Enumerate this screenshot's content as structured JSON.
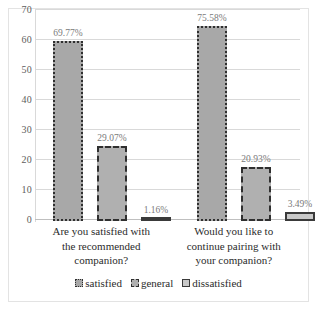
{
  "chart_data": {
    "type": "bar",
    "title": "",
    "subtitle": "",
    "xlabel": "",
    "ylabel": "",
    "ylim": [
      0,
      70
    ],
    "ytick_step": 10,
    "yticks": [
      "70",
      "60",
      "50",
      "40",
      "30",
      "20",
      "10",
      "0"
    ],
    "grid": true,
    "legend_position": "bottom",
    "categories": [
      "Are you satisfied with the recommended companion?",
      "Would you like to continue pairing with your companion?"
    ],
    "category_lines": [
      [
        "Are you satisfied with",
        "the recommended",
        "companion?"
      ],
      [
        "Would you like to",
        "continue pairing with",
        "your companion?"
      ]
    ],
    "series": [
      {
        "name": "satisfied",
        "values": [
          69.77,
          75.58
        ],
        "labels": [
          "69.77%",
          "75.58%"
        ],
        "fill": "#a8a8a8",
        "border": "#2f2f2f",
        "border_style": "dotted"
      },
      {
        "name": "general",
        "values": [
          29.07,
          20.93
        ],
        "labels": [
          "29.07%",
          "20.93%"
        ],
        "fill": "#b0b0b0",
        "border": "#2f2f2f",
        "border_style": "dashed"
      },
      {
        "name": "dissatisfied",
        "values": [
          1.16,
          3.49
        ],
        "labels": [
          "1.16%",
          "3.49%"
        ],
        "fill": "#c9c9c9",
        "border": "#3a3a3a",
        "border_style": "solid"
      }
    ],
    "bar_display_heights": [
      [
        60.0,
        65.0
      ],
      [
        25.0,
        18.0
      ],
      [
        1.0,
        3.0
      ]
    ],
    "colors": {
      "background": "#ffffff",
      "gridline": "#d9d9d9",
      "axis_text": "#5d5d5d",
      "label_text": "#7a7a7a",
      "category_text": "#2b2b2b",
      "frame": "#e3e3e3"
    }
  }
}
